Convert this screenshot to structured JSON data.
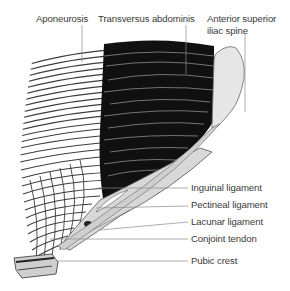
{
  "figure": {
    "colors": {
      "muscle": "#111111",
      "aponeurosis_lines": "#3c3c3c",
      "bone": "#e6e6e6",
      "leader": "#8a8a8a",
      "text": "#3a3a3a"
    },
    "labels_top": [
      {
        "id": "aponeurosis",
        "text": "Aponeurosis"
      },
      {
        "id": "transversus",
        "text": "Transversus abdominis"
      },
      {
        "id": "asis_line1",
        "text": "Anterior superior"
      },
      {
        "id": "asis_line2",
        "text": "iliac spine"
      }
    ],
    "labels_right": [
      {
        "id": "inguinal",
        "text": "Inguinal ligament"
      },
      {
        "id": "pectineal",
        "text": "Pectineal ligament"
      },
      {
        "id": "lacunar",
        "text": "Lacunar ligament"
      },
      {
        "id": "conjoint",
        "text": "Conjoint tendon"
      },
      {
        "id": "pubic",
        "text": "Pubic crest"
      }
    ]
  }
}
